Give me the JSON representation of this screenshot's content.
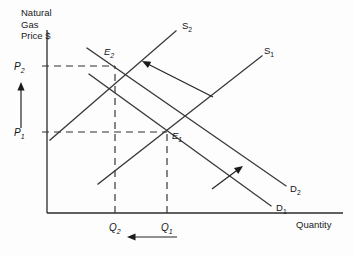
{
  "chart_data": {
    "type": "line",
    "title": "",
    "ylabel_lines": [
      "Natural",
      "Gas",
      "Price $"
    ],
    "xlabel": "Quantity",
    "grid": false,
    "legend": "inline-curve-labels",
    "axis_origin": [
      47,
      213
    ],
    "axis_x_end": [
      343,
      213
    ],
    "axis_y_top": [
      47,
      30
    ],
    "price_levels": [
      {
        "id": "P2",
        "base": "P",
        "sub": "2",
        "y": 66,
        "label_x": 14,
        "dashed_to_x": 115
      },
      {
        "id": "P1",
        "base": "P",
        "sub": "1",
        "y": 132,
        "label_x": 14,
        "dashed_to_x": 167
      }
    ],
    "quantity_levels": [
      {
        "id": "Q2",
        "base": "Q",
        "sub": "2",
        "x": 115,
        "label_y": 231,
        "dashed_to_y": 66
      },
      {
        "id": "Q1",
        "base": "Q",
        "sub": "1",
        "x": 167,
        "label_y": 231,
        "dashed_to_y": 132
      }
    ],
    "series": [
      {
        "name": "S2",
        "base": "S",
        "sub": "2",
        "kind": "supply",
        "x1": 50,
        "y1": 140,
        "x2": 176,
        "y2": 31,
        "label_x": 182,
        "label_y": 29
      },
      {
        "name": "S1",
        "base": "S",
        "sub": "1",
        "kind": "supply",
        "x1": 98,
        "y1": 184,
        "x2": 262,
        "y2": 56,
        "label_x": 264,
        "label_y": 54
      },
      {
        "name": "D2",
        "base": "D",
        "sub": "2",
        "kind": "demand",
        "x1": 87,
        "y1": 48,
        "x2": 286,
        "y2": 186,
        "label_x": 290,
        "label_y": 192
      },
      {
        "name": "D1",
        "base": "D",
        "sub": "1",
        "kind": "demand",
        "x1": 89,
        "y1": 74,
        "x2": 271,
        "y2": 206,
        "label_x": 276,
        "label_y": 211
      }
    ],
    "equilibria": [
      {
        "id": "E2",
        "base": "E",
        "sub": "2",
        "x": 115,
        "y": 66,
        "label_x": 104,
        "label_y": 55
      },
      {
        "id": "E1",
        "base": "E",
        "sub": "1",
        "x": 167,
        "y": 132,
        "label_x": 172,
        "label_y": 139
      }
    ],
    "shift_arrows": [
      {
        "name": "supply-shift-arrow",
        "meaning": "supply curve shifts left from S1 to S2",
        "x1": 213,
        "y1": 97,
        "x2": 142,
        "y2": 61,
        "head_angle_deg": 207
      },
      {
        "name": "demand-shift-arrow",
        "meaning": "demand curve shifts right from D1 to D2",
        "x1": 212,
        "y1": 189,
        "x2": 243,
        "y2": 166,
        "head_angle_deg": -36
      },
      {
        "name": "price-increase-arrow",
        "meaning": "price rises from P1 to P2",
        "x1": 21,
        "y1": 128,
        "x2": 21,
        "y2": 82,
        "head_angle_deg": -90
      },
      {
        "name": "quantity-decrease-arrow",
        "meaning": "quantity falls from Q1 to Q2",
        "x1": 177,
        "y1": 237,
        "x2": 127,
        "y2": 237,
        "head_angle_deg": 180
      }
    ]
  },
  "labels": {
    "ylabel_line1": "Natural",
    "ylabel_line2": "Gas",
    "ylabel_line3": "Price $",
    "xlabel": "Quantity",
    "p2_base": "P",
    "p2_sub": "2",
    "p1_base": "P",
    "p1_sub": "1",
    "q2_base": "Q",
    "q2_sub": "2",
    "q1_base": "Q",
    "q1_sub": "1",
    "e2_base": "E",
    "e2_sub": "2",
    "e1_base": "E",
    "e1_sub": "1",
    "s2_base": "S",
    "s2_sub": "2",
    "s1_base": "S",
    "s1_sub": "1",
    "d2_base": "D",
    "d2_sub": "2",
    "d1_base": "D",
    "d1_sub": "1"
  }
}
